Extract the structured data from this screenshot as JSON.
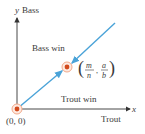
{
  "diagram": {
    "y_axis": {
      "var": "y",
      "label": "Bass"
    },
    "x_axis": {
      "var": "x",
      "label": "Trout"
    },
    "regions": {
      "upper": "Bass win",
      "lower": "Trout win"
    },
    "origin_label": "(0, 0)",
    "point_label": {
      "num1": "m",
      "den1": "n",
      "num2": "a",
      "den2": "b"
    },
    "colors": {
      "line": "#4aa3d8",
      "point": "#d24a1c",
      "halo": "#f2a98a",
      "axis": "#333333"
    }
  }
}
